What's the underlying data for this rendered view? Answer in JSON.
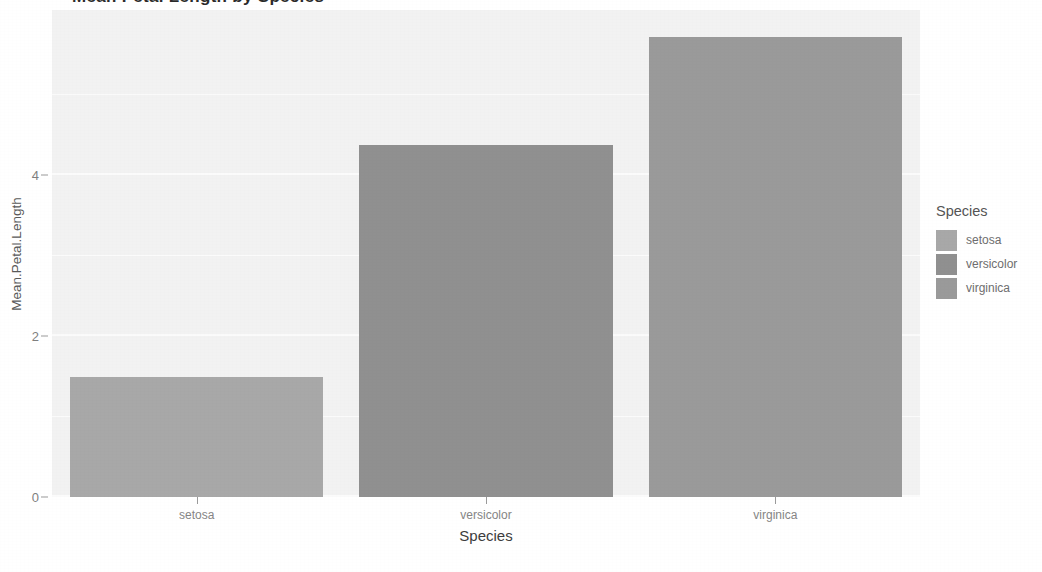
{
  "figure": {
    "title_clipped": "Mean Petal Length by Species",
    "background_color": "#ffffff"
  },
  "panel": {
    "background_color": "#f2f2f2",
    "gridline_color": "#fbfbfb"
  },
  "y_axis": {
    "title": "Mean.Petal.Length",
    "ticks": [
      "0",
      "2",
      "4"
    ]
  },
  "x_axis": {
    "title": "Species",
    "ticks": [
      "setosa",
      "versicolor",
      "virginica"
    ]
  },
  "legend": {
    "title": "Species",
    "items": [
      {
        "label": "setosa",
        "color": "#a8a8a8"
      },
      {
        "label": "versicolor",
        "color": "#909090"
      },
      {
        "label": "virginica",
        "color": "#9a9a9a"
      }
    ]
  },
  "chart_data": {
    "type": "bar",
    "title": "Mean Petal Length by Species",
    "xlabel": "Species",
    "ylabel": "Mean.Petal.Length",
    "categories": [
      "setosa",
      "versicolor",
      "virginica"
    ],
    "values": [
      1.49,
      4.37,
      5.71
    ],
    "colors": [
      "#a8a8a8",
      "#909090",
      "#9a9a9a"
    ],
    "ylim": [
      0,
      6.05
    ],
    "y_ticks": [
      0,
      2,
      4
    ],
    "y_minor_ticks": [
      1,
      3,
      5
    ],
    "grid": true,
    "legend": {
      "title": "Species",
      "position": "right",
      "entries": [
        "setosa",
        "versicolor",
        "virginica"
      ]
    }
  }
}
